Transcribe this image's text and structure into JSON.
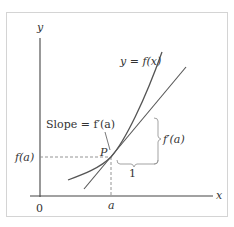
{
  "diagram": {
    "axes": {
      "x_label": "x",
      "y_label": "y",
      "origin_label": "0"
    },
    "labels": {
      "curve": "y = f(x)",
      "slope": "Slope = f′(a)",
      "point": "P",
      "f_of_a": "f(a)",
      "a": "a",
      "run": "1",
      "rise": "f′(a)"
    },
    "colors": {
      "curve": "#555555",
      "tangent": "#555555",
      "axes": "#444444",
      "dashed": "#888888",
      "bracket": "#999999",
      "text": "#333333",
      "frame": "#d4d4d4"
    }
  }
}
